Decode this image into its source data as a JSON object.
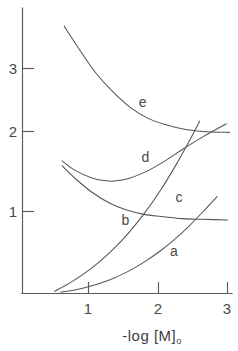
{
  "chart_data": {
    "type": "line",
    "title": "",
    "subtitle": "",
    "xlabel": "-log [M]",
    "xlabel_subscript": "o",
    "xlabel_full": "-log [M]o",
    "ylabel": "",
    "xlim": [
      0,
      3.08
    ],
    "ylim": [
      0,
      3.95
    ],
    "grid": false,
    "legend_position": "inline-curve-labels",
    "xticks": [
      1,
      2,
      3
    ],
    "xtick_labels": [
      "1",
      "2",
      "3"
    ],
    "yticks": [
      1,
      2,
      3
    ],
    "ytick_labels": [
      "1",
      "2",
      "3"
    ],
    "series": [
      {
        "name": "a",
        "label": "a",
        "label_x": 2.18,
        "label_y": 0.53,
        "x": [
          0.55,
          0.75,
          1.0,
          1.25,
          1.5,
          1.75,
          2.0,
          2.2,
          2.4,
          2.6,
          2.8
        ],
        "y": [
          0.02,
          0.05,
          0.11,
          0.19,
          0.3,
          0.44,
          0.61,
          0.77,
          0.95,
          1.15,
          1.36
        ]
      },
      {
        "name": "b",
        "label": "b",
        "label_x": 1.48,
        "label_y": 0.96,
        "x": [
          0.46,
          0.7,
          1.0,
          1.25,
          1.5,
          1.75,
          2.0,
          2.2,
          2.4,
          2.55
        ],
        "y": [
          0.03,
          0.16,
          0.36,
          0.57,
          0.82,
          1.12,
          1.47,
          1.79,
          2.14,
          2.42
        ]
      },
      {
        "name": "c",
        "label": "c",
        "label_x": 2.25,
        "label_y": 1.28,
        "x": [
          0.57,
          0.75,
          1.0,
          1.25,
          1.5,
          1.75,
          2.0,
          2.3,
          2.6,
          2.95
        ],
        "y": [
          1.79,
          1.62,
          1.42,
          1.27,
          1.17,
          1.11,
          1.08,
          1.05,
          1.04,
          1.03
        ]
      },
      {
        "name": "d",
        "label": "d",
        "label_x": 1.77,
        "label_y": 1.84,
        "x": [
          0.57,
          0.75,
          1.0,
          1.2,
          1.35,
          1.55,
          1.8,
          2.05,
          2.3,
          2.6,
          2.93
        ],
        "y": [
          1.86,
          1.73,
          1.62,
          1.58,
          1.58,
          1.62,
          1.72,
          1.86,
          2.02,
          2.2,
          2.38
        ]
      },
      {
        "name": "e",
        "label": "e",
        "label_x": 1.73,
        "label_y": 2.62,
        "x": [
          0.6,
          0.8,
          1.05,
          1.3,
          1.55,
          1.8,
          2.05,
          2.35,
          2.65,
          2.98
        ],
        "y": [
          3.75,
          3.45,
          3.1,
          2.83,
          2.61,
          2.46,
          2.37,
          2.3,
          2.27,
          2.26
        ]
      }
    ]
  },
  "axes": {
    "x_axis_name": "x-axis",
    "y_axis_name": "y-axis"
  }
}
